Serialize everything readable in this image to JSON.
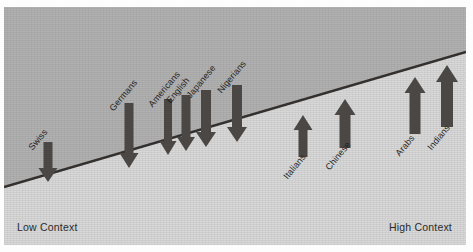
{
  "figure": {
    "title_text": "",
    "axis": {
      "left_label": "Low Context",
      "right_label": "High Context"
    },
    "colors": {
      "band_upper": "#b2b2b2",
      "band_lower": "#d9d9d9",
      "divider_line": "#33302e",
      "arrow_fill": "#4a4744",
      "text": "#1f1f1f",
      "page_background": "#fdfdfd"
    }
  },
  "chart_data": {
    "type": "scatter",
    "title": "",
    "xlabel": "",
    "ylabel": "",
    "grid": false,
    "legend_position": "none",
    "axis_endpoint_labels": [
      "Low Context",
      "High Context"
    ],
    "categories": [
      "Swiss",
      "Germans",
      "Americans",
      "English",
      "Japanese",
      "Nigerians",
      "Italians",
      "Chinese",
      "Arabs",
      "Indians"
    ],
    "points": [
      {
        "label": "Swiss",
        "direction": "down",
        "x": 44,
        "shaft_top": 135,
        "tip_y": 175,
        "shaft_width": 9,
        "head_width": 19,
        "head_height": 14,
        "label_x": 30,
        "label_y": 135
      },
      {
        "label": "Germans",
        "direction": "down",
        "x": 125,
        "shaft_top": 96,
        "tip_y": 161,
        "shaft_width": 9,
        "head_width": 19,
        "head_height": 15,
        "label_x": 111,
        "label_y": 96
      },
      {
        "label": "Americans",
        "direction": "down",
        "x": 164,
        "shaft_top": 92,
        "tip_y": 148,
        "shaft_width": 8,
        "head_width": 17,
        "head_height": 14,
        "label_x": 150,
        "label_y": 92
      },
      {
        "label": "English",
        "direction": "down",
        "x": 182,
        "shaft_top": 88,
        "tip_y": 144,
        "shaft_width": 9,
        "head_width": 18,
        "head_height": 14,
        "label_x": 168,
        "label_y": 88
      },
      {
        "label": "Japanese",
        "direction": "down",
        "x": 202,
        "shaft_top": 83,
        "tip_y": 140,
        "shaft_width": 10,
        "head_width": 20,
        "head_height": 15,
        "label_x": 188,
        "label_y": 83
      },
      {
        "label": "Nigerians",
        "direction": "down",
        "x": 233,
        "shaft_top": 78,
        "tip_y": 135,
        "shaft_width": 10,
        "head_width": 20,
        "head_height": 15,
        "label_x": 219,
        "label_y": 78
      },
      {
        "label": "Italians",
        "direction": "up",
        "x": 299,
        "shaft_top": 108,
        "tip_y": 150,
        "shaft_width": 9,
        "head_width": 19,
        "head_height": 15,
        "label_x": 285,
        "label_y": 164
      },
      {
        "label": "Chinese",
        "direction": "up",
        "x": 341,
        "shaft_top": 92,
        "tip_y": 141,
        "shaft_width": 11,
        "head_width": 21,
        "head_height": 16,
        "label_x": 327,
        "label_y": 155
      },
      {
        "label": "Arabs",
        "direction": "up",
        "x": 411,
        "shaft_top": 70,
        "tip_y": 127,
        "shaft_width": 11,
        "head_width": 21,
        "head_height": 16,
        "label_x": 397,
        "label_y": 141
      },
      {
        "label": "Indians",
        "direction": "up",
        "x": 443,
        "shaft_top": 58,
        "tip_y": 120,
        "shaft_width": 12,
        "head_width": 22,
        "head_height": 17,
        "label_x": 429,
        "label_y": 135
      }
    ],
    "divider_line": {
      "x1": 0,
      "y1": 180,
      "x2": 462,
      "y2": 45
    }
  }
}
